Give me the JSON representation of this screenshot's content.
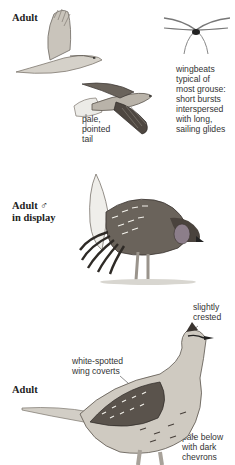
{
  "page": {
    "truncated_top_text": "ー ーー ー ー ー ー ー",
    "sections": [
      {
        "heading": "Adult",
        "annotations": {
          "tail": [
            "pale,",
            "pointed",
            "tail"
          ],
          "wingbeats": [
            "wingbeats",
            "typical of",
            "most grouse:",
            "short bursts",
            "interspersed",
            "with long,",
            "sailing glides"
          ]
        }
      },
      {
        "heading_line1": "Adult ♂",
        "heading_line2": "in display"
      },
      {
        "heading": "Adult",
        "annotations": {
          "crest": [
            "slightly",
            "crested"
          ],
          "coverts": [
            "white-spotted",
            "wing coverts"
          ],
          "underparts": [
            "pale below",
            "with dark",
            "chevrons"
          ]
        }
      }
    ],
    "icons": {
      "flight_top": "flying-grouse-icon",
      "flight_bottom": "flying-grouse-spread-icon",
      "wingbeat": "wingbeat-diagram-icon",
      "display": "displaying-grouse-icon",
      "standing": "standing-grouse-icon"
    },
    "colors": {
      "ink": "#222222",
      "feather_dark": "#3a3430",
      "feather_mid": "#8a847c",
      "feather_light": "#d8d4cc",
      "air_sac": "#8c7e8a"
    }
  }
}
